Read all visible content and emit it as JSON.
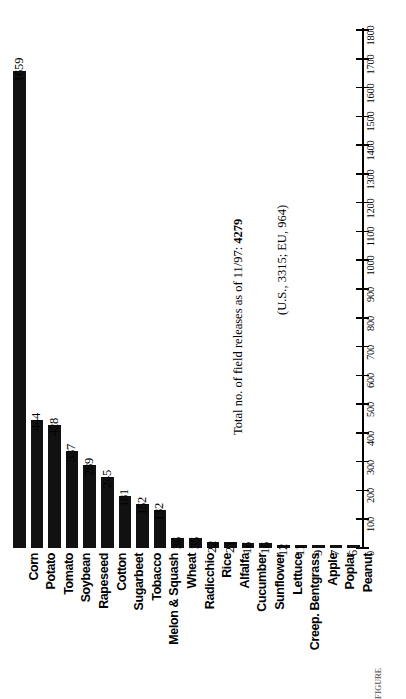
{
  "chart_data": {
    "type": "bar",
    "orientation": "rotated-vertical",
    "title": "",
    "xlabel": "",
    "ylabel": "",
    "ylim": [
      0,
      1800
    ],
    "ytick_step": 100,
    "grid": false,
    "legend": null,
    "categories": [
      "Corn",
      "Potato",
      "Tomato",
      "Soybean",
      "Rapeseed",
      "Cotton",
      "Sugarbeet",
      "Tobacco",
      "Melon & Squash",
      "Wheat",
      "Radicchio",
      "Rice",
      "Alfalfa",
      "Cucumber",
      "Sunflower",
      "Lettuce",
      "Creep. Bentgrass",
      "Apple",
      "Poplar",
      "Peanut"
    ],
    "values": [
      1659,
      444,
      428,
      337,
      289,
      245,
      181,
      152,
      132,
      36,
      35,
      22,
      21,
      16,
      16,
      12,
      11,
      9,
      7,
      6
    ],
    "ticks": [
      0,
      100,
      200,
      300,
      400,
      500,
      600,
      700,
      800,
      900,
      1000,
      1100,
      1200,
      1300,
      1400,
      1500,
      1600,
      1700,
      1800
    ],
    "annotations": [
      {
        "id": "total",
        "prefix": "Total no. of field releases as of 11/97:",
        "value": "4279"
      },
      {
        "id": "breakdown",
        "text": "(U.S., 3315; EU, 964)"
      }
    ]
  },
  "caption": {
    "text": "FIGURE"
  }
}
